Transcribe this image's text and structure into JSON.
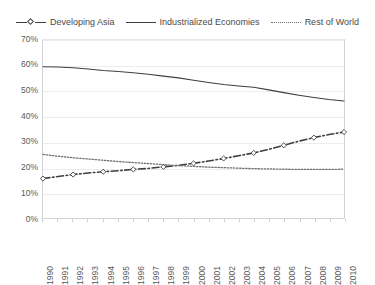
{
  "legend": {
    "position": "top-center",
    "entries": [
      {
        "label": "Developing Asia",
        "style": "dashed-marker",
        "color": "#3f3f3f"
      },
      {
        "label": "Industrialized Economies",
        "style": "solid",
        "color": "#3f3f3f"
      },
      {
        "label": "Rest of World",
        "style": "dotted",
        "color": "#6e6e6e"
      }
    ]
  },
  "axes": {
    "y_ticks": [
      "0%",
      "10%",
      "20%",
      "30%",
      "40%",
      "50%",
      "60%",
      "70%"
    ],
    "x_ticks": [
      "1990",
      "1991",
      "1992",
      "1993",
      "1994",
      "1995",
      "1996",
      "1997",
      "1998",
      "1999",
      "2000",
      "2001",
      "2002",
      "2003",
      "2004",
      "2005",
      "2006",
      "2007",
      "2008",
      "2009",
      "2010"
    ]
  },
  "chart_data": {
    "type": "line",
    "title": "",
    "subtitle": "",
    "xlabel": "",
    "ylabel": "",
    "ylim": [
      0,
      70
    ],
    "ytick_step": 10,
    "yunit": "%",
    "grid": true,
    "legend_position": "top-center",
    "x": [
      1990,
      1991,
      1992,
      1993,
      1994,
      1995,
      1996,
      1997,
      1998,
      1999,
      2000,
      2001,
      2002,
      2003,
      2004,
      2005,
      2006,
      2007,
      2008,
      2009,
      2010
    ],
    "categories": [
      "1990",
      "1991",
      "1992",
      "1993",
      "1994",
      "1995",
      "1996",
      "1997",
      "1998",
      "1999",
      "2000",
      "2001",
      "2002",
      "2003",
      "2004",
      "2005",
      "2006",
      "2007",
      "2008",
      "2009",
      "2010"
    ],
    "series": [
      {
        "name": "Developing Asia",
        "style": "dashed",
        "marker": "diamond",
        "color": "#3f3f3f",
        "values": [
          15.5,
          16.3,
          17.1,
          17.7,
          18.2,
          18.6,
          19.1,
          19.5,
          20.1,
          20.7,
          21.5,
          22.4,
          23.4,
          24.5,
          25.6,
          27.0,
          28.6,
          30.2,
          31.6,
          32.8,
          33.8
        ]
      },
      {
        "name": "Industrialized Economies",
        "style": "solid",
        "marker": "none",
        "color": "#3f3f3f",
        "values": [
          59.5,
          59.4,
          59.1,
          58.6,
          58.0,
          57.6,
          57.1,
          56.5,
          55.8,
          55.1,
          54.2,
          53.3,
          52.5,
          51.9,
          51.4,
          50.4,
          49.3,
          48.3,
          47.4,
          46.6,
          46.0
        ]
      },
      {
        "name": "Rest of World",
        "style": "dotted",
        "marker": "none",
        "color": "#6e6e6e",
        "values": [
          25.0,
          24.3,
          23.7,
          23.2,
          22.7,
          22.2,
          21.8,
          21.4,
          21.0,
          20.6,
          20.3,
          20.0,
          19.8,
          19.6,
          19.4,
          19.3,
          19.2,
          19.1,
          19.1,
          19.1,
          19.2
        ]
      }
    ]
  }
}
